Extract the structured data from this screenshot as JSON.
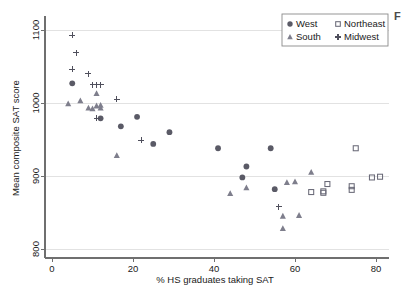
{
  "figure": {
    "edge_fragment": "F"
  },
  "chart_data": {
    "type": "scatter",
    "title": "",
    "xlabel": "% HS graduates taking SAT",
    "ylabel": "Mean composite SAT score",
    "xlim": [
      -2,
      84
    ],
    "ylim": [
      790,
      1105
    ],
    "xticks": [
      0,
      20,
      40,
      60,
      80
    ],
    "yticks": [
      800,
      900,
      1000,
      1100
    ],
    "xtick_labels": [
      "0",
      "20",
      "40",
      "60",
      "80"
    ],
    "ytick_labels": [
      "800",
      "900",
      "1000",
      "1100"
    ],
    "grid": "horizontal",
    "legend_position": "top-right",
    "series": [
      {
        "name": "West",
        "marker": "filled-circle",
        "color": "#5a5a66",
        "points": [
          [
            5,
            1027
          ],
          [
            12,
            979
          ],
          [
            17,
            968
          ],
          [
            21,
            981
          ],
          [
            25,
            944
          ],
          [
            29,
            960
          ],
          [
            41,
            938
          ],
          [
            47,
            898
          ],
          [
            48,
            913
          ],
          [
            54,
            938
          ],
          [
            55,
            882
          ]
        ]
      },
      {
        "name": "South",
        "marker": "filled-triangle",
        "color": "#7e7e8c",
        "points": [
          [
            4,
            999
          ],
          [
            7,
            1003
          ],
          [
            9,
            993
          ],
          [
            10,
            992
          ],
          [
            11,
            996
          ],
          [
            11,
            1013
          ],
          [
            12,
            993
          ],
          [
            12,
            997
          ],
          [
            16,
            928
          ],
          [
            44,
            876
          ],
          [
            48,
            884
          ],
          [
            57,
            845
          ],
          [
            57,
            828
          ],
          [
            58,
            891
          ],
          [
            60,
            892
          ],
          [
            61,
            846
          ],
          [
            64,
            905
          ]
        ]
      },
      {
        "name": "Northeast",
        "marker": "open-square",
        "color": "#6a6a78",
        "points": [
          [
            64,
            878
          ],
          [
            67,
            877
          ],
          [
            67,
            879
          ],
          [
            68,
            889
          ],
          [
            74,
            881
          ],
          [
            74,
            886
          ],
          [
            75,
            938
          ],
          [
            79,
            898
          ],
          [
            81,
            899
          ]
        ]
      },
      {
        "name": "Midwest",
        "marker": "plus",
        "color": "#4f4f5c",
        "points": [
          [
            5,
            1093
          ],
          [
            6,
            1069
          ],
          [
            5,
            1046
          ],
          [
            9,
            1040
          ],
          [
            10,
            1025
          ],
          [
            11,
            1025
          ],
          [
            12,
            1025
          ],
          [
            11,
            979
          ],
          [
            16,
            1005
          ],
          [
            22,
            949
          ],
          [
            56,
            858
          ]
        ]
      }
    ]
  },
  "legend": {
    "entries": [
      {
        "label": "West",
        "marker": "filled-circle"
      },
      {
        "label": "Northeast",
        "marker": "open-square"
      },
      {
        "label": "South",
        "marker": "filled-triangle"
      },
      {
        "label": "Midwest",
        "marker": "plus"
      }
    ]
  }
}
